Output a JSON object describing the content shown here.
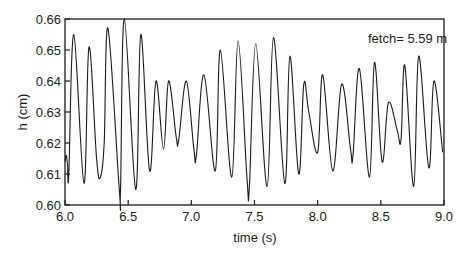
{
  "chart_data": {
    "type": "line",
    "title": "",
    "xlabel": "time (s)",
    "ylabel": "h (cm)",
    "xlim": [
      6.0,
      9.0
    ],
    "ylim": [
      0.6,
      0.66
    ],
    "xticks": [
      "6.0",
      "6.5",
      "7.0",
      "7.5",
      "8.0",
      "8.5",
      "9.0"
    ],
    "yticks": [
      "0.60",
      "0.61",
      "0.62",
      "0.63",
      "0.64",
      "0.65",
      "0.66"
    ],
    "grid": false,
    "legend": null,
    "annotations": [
      {
        "text": "fetch= 5.59 m",
        "position": "top-right"
      }
    ],
    "series": [
      {
        "name": "h",
        "color": "#1a1a1a",
        "x": [
          6.0,
          6.01,
          6.02,
          6.03,
          6.07,
          6.15,
          6.19,
          6.25,
          6.28,
          6.31,
          6.34,
          6.43,
          6.44,
          6.47,
          6.56,
          6.6,
          6.67,
          6.72,
          6.78,
          6.82,
          6.88,
          6.9,
          6.96,
          7.02,
          7.04,
          7.1,
          7.19,
          7.23,
          7.32,
          7.37,
          7.44,
          7.46,
          7.51,
          7.6,
          7.65,
          7.74,
          7.78,
          7.85,
          7.89,
          7.93,
          8.0,
          8.04,
          8.12,
          8.19,
          8.26,
          8.28,
          8.33,
          8.41,
          8.45,
          8.51,
          8.56,
          8.63,
          8.66,
          8.69,
          8.76,
          8.8,
          8.88,
          8.92,
          8.99
        ],
        "values": [
          0.614,
          0.616,
          0.613,
          0.61,
          0.655,
          0.607,
          0.651,
          0.615,
          0.609,
          0.62,
          0.657,
          0.605,
          0.606,
          0.66,
          0.605,
          0.655,
          0.611,
          0.64,
          0.618,
          0.64,
          0.622,
          0.621,
          0.64,
          0.618,
          0.616,
          0.642,
          0.611,
          0.65,
          0.609,
          0.653,
          0.609,
          0.606,
          0.652,
          0.606,
          0.654,
          0.607,
          0.648,
          0.61,
          0.639,
          0.63,
          0.617,
          0.642,
          0.611,
          0.639,
          0.618,
          0.616,
          0.644,
          0.609,
          0.646,
          0.614,
          0.633,
          0.624,
          0.621,
          0.645,
          0.606,
          0.648,
          0.612,
          0.64,
          0.617
        ]
      }
    ]
  },
  "labels": {
    "xlabel": "time (s)",
    "ylabel": "h (cm)",
    "annotation": "fetch= 5.59 m"
  }
}
